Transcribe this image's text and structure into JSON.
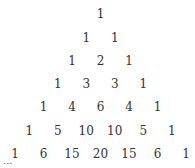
{
  "rows": [
    [
      "1"
    ],
    [
      "1",
      "1"
    ],
    [
      "1",
      "2",
      "1"
    ],
    [
      "1",
      "3",
      "3",
      "1"
    ],
    [
      "1",
      "4",
      "6",
      "4",
      "1"
    ],
    [
      "1",
      "5",
      "10",
      "10",
      "5",
      "1"
    ],
    [
      "1",
      "6",
      "15",
      "20",
      "15",
      "6",
      "1"
    ]
  ],
  "ellipsis": "..."
}
